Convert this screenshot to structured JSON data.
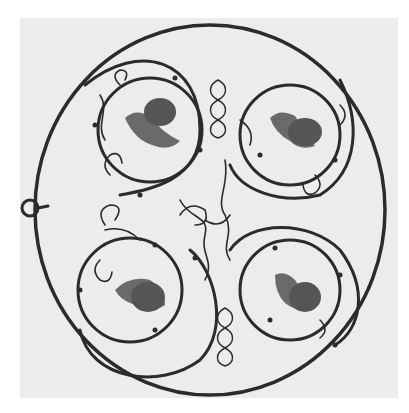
{
  "image": {
    "alt": "Black and white photograph of a circular wrought-iron grille with four roundels, each containing a grape cluster and leaf, surrounded by scrolling tendrils and figure-eight knots",
    "colors": {
      "background": "#ececec",
      "iron": "#2b2b2b",
      "grape": "#555555",
      "leaf": "#6a6a6a"
    },
    "roundels": [
      {
        "cx": 150,
        "cy": 130,
        "r": 52
      },
      {
        "cx": 290,
        "cy": 135,
        "r": 50
      },
      {
        "cx": 130,
        "cy": 290,
        "r": 52
      },
      {
        "cx": 290,
        "cy": 290,
        "r": 50
      }
    ]
  }
}
